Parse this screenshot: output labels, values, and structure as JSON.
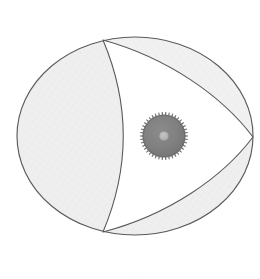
{
  "figure": {
    "name": "rotary-engine-cross-section",
    "width": 260,
    "height": 279,
    "background_color": "#ffffff"
  },
  "palette": {
    "outline": "#5a5a5a",
    "outline_light": "#7d7d7d",
    "chamber_fill": "#eeeeee",
    "chamber_fill_alt": "#f1f1f1",
    "rotor_fill": "#ffffff",
    "gear_body": "#7f7f7f",
    "gear_teeth": "#6f6f6f",
    "gear_hub": "#b4b4b4",
    "caption_text": "#f2f2f2"
  },
  "housing": {
    "name": "epitrochoid-housing",
    "label": "Epitrochoid housing",
    "center_x": 135,
    "center_y": 136,
    "radius_x": 118,
    "radius_y": 99,
    "stroke_width": 1.1
  },
  "rotor": {
    "name": "reuleaux-triangle-rotor",
    "label": "Reuleaux triangle rotor",
    "stroke_width": 1.1,
    "apexes": [
      {
        "name": "apex-top",
        "x": 103,
        "y": 40
      },
      {
        "name": "apex-right",
        "x": 253,
        "y": 137
      },
      {
        "name": "apex-bottom",
        "x": 103,
        "y": 232
      }
    ],
    "flank_sag": 34
  },
  "chambers": [
    {
      "name": "chamber-left",
      "label": "Left chamber",
      "fill": "#eeeeee",
      "position": "left crescent"
    },
    {
      "name": "chamber-upper-right",
      "label": "Upper right chamber",
      "fill": "#f1f1f1",
      "position": "upper right sliver"
    },
    {
      "name": "chamber-lower-right",
      "label": "Lower right chamber",
      "fill": "#eeeeee",
      "position": "lower right crescent"
    }
  ],
  "gear": {
    "name": "stationary-gear",
    "label": "Stationary timing gear",
    "center_x": 164,
    "center_y": 136,
    "outer_radius": 24,
    "root_radius": 21,
    "body_radius": 20.5,
    "hub_radius": 4.5,
    "tooth_count": 42,
    "body_color": "#7f7f7f",
    "tooth_color": "#6f6f6f",
    "hub_color": "#b4b4b4"
  },
  "caption": {
    "name": "faint-caption",
    "text": "· · · · ·",
    "visible": true
  }
}
